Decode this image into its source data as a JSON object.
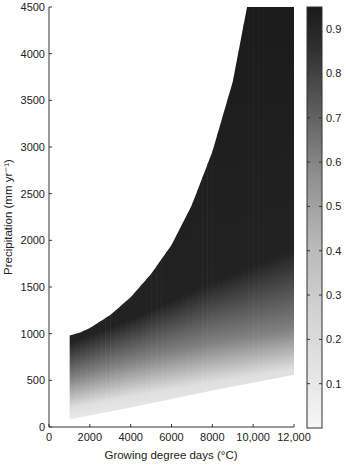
{
  "chart_data": {
    "type": "heatmap",
    "title": "",
    "xlabel": "Growing degree days (°C)",
    "ylabel": "Precipitation (mm yr⁻¹)",
    "xlim": [
      0,
      12000
    ],
    "ylim": [
      0,
      4500
    ],
    "grid": false,
    "x_ticks": [
      0,
      2000,
      4000,
      6000,
      8000,
      10000,
      12000
    ],
    "x_tick_labels": [
      "0",
      "2000",
      "4000",
      "6000",
      "8000",
      "10,000",
      "12,000"
    ],
    "y_ticks": [
      0,
      500,
      1000,
      1500,
      2000,
      2500,
      3000,
      3500,
      4000,
      4500
    ],
    "y_tick_labels": [
      "0",
      "500",
      "1000",
      "1500",
      "2000",
      "2500",
      "3000",
      "3500",
      "4000",
      "4500"
    ],
    "colorbar": {
      "position": "right",
      "range": [
        0,
        0.95
      ],
      "ticks": [
        0.1,
        0.2,
        0.3,
        0.4,
        0.5,
        0.6,
        0.7,
        0.8,
        0.9
      ],
      "tick_labels": [
        "0.1",
        "0.2",
        "0.3",
        "0.4",
        "0.5",
        "0.6",
        "0.7",
        "0.8",
        "0.9"
      ],
      "colormap": "grayscale (white = low, black = high)"
    },
    "domain": {
      "left_edge_gdd": 1000,
      "lower_boundary": [
        {
          "gdd": 1000,
          "precip": 80
        },
        {
          "gdd": 4000,
          "precip": 210
        },
        {
          "gdd": 8000,
          "precip": 390
        },
        {
          "gdd": 12000,
          "precip": 560
        }
      ],
      "upper_boundary": [
        {
          "gdd": 1000,
          "precip": 980
        },
        {
          "gdd": 1500,
          "precip": 1010
        },
        {
          "gdd": 2000,
          "precip": 1060
        },
        {
          "gdd": 3000,
          "precip": 1200
        },
        {
          "gdd": 4000,
          "precip": 1390
        },
        {
          "gdd": 5000,
          "precip": 1640
        },
        {
          "gdd": 6000,
          "precip": 1950
        },
        {
          "gdd": 7000,
          "precip": 2380
        },
        {
          "gdd": 8000,
          "precip": 2950
        },
        {
          "gdd": 9000,
          "precip": 3700
        },
        {
          "gdd": 9700,
          "precip": 4500
        },
        {
          "gdd": 12000,
          "precip": 4500
        }
      ],
      "value_gradient": [
        {
          "gdd": 1000,
          "precip_at_0.1": 200,
          "precip_at_0.5": 520,
          "precip_at_0.9": 900
        },
        {
          "gdd": 4000,
          "precip_at_0.1": 330,
          "precip_at_0.5": 700,
          "precip_at_0.9": 1150
        },
        {
          "gdd": 8000,
          "precip_at_0.1": 480,
          "precip_at_0.5": 900,
          "precip_at_0.9": 1550
        },
        {
          "gdd": 12000,
          "precip_at_0.1": 620,
          "precip_at_0.5": 1050,
          "precip_at_0.9": 1900
        }
      ],
      "max_value_region": "upper portion near boundary ≈ 0.93"
    }
  },
  "colors": {
    "background": "#ffffff",
    "axis": "#333333",
    "high": "#1a1a1a",
    "low": "#f4f4f4"
  }
}
